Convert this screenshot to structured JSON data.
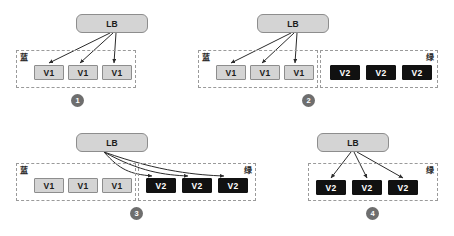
{
  "diagram": {
    "colors": {
      "lb_fill": "#d4d4d4",
      "lb_border": "#8d8d8d",
      "v1_fill": "#d4d4d4",
      "v1_text": "#1b1b1b",
      "v2_fill": "#111111",
      "v2_text": "#ffffff",
      "group_border": "#9a9a9a",
      "badge_fill": "#6e6e6e",
      "arrow": "#2b2b2b",
      "background": "#ffffff"
    },
    "labels": {
      "lb": "LB",
      "v1": "V1",
      "v2": "V2",
      "blue_group": "蓝",
      "green_group": "绿"
    },
    "panels": [
      {
        "id": "panel-1",
        "step": "1",
        "lb": "LB",
        "groups": [
          {
            "name": "blue",
            "label": "蓝",
            "label_side": "left",
            "nodes": [
              "V1",
              "V1",
              "V1"
            ],
            "node_type": "v1",
            "receives_traffic": true
          }
        ]
      },
      {
        "id": "panel-2",
        "step": "2",
        "lb": "LB",
        "groups": [
          {
            "name": "blue",
            "label": "蓝",
            "label_side": "left",
            "nodes": [
              "V1",
              "V1",
              "V1"
            ],
            "node_type": "v1",
            "receives_traffic": true
          },
          {
            "name": "green",
            "label": "绿",
            "label_side": "right",
            "nodes": [
              "V2",
              "V2",
              "V2"
            ],
            "node_type": "v2",
            "receives_traffic": false
          }
        ]
      },
      {
        "id": "panel-3",
        "step": "3",
        "lb": "LB",
        "groups": [
          {
            "name": "blue",
            "label": "蓝",
            "label_side": "left",
            "nodes": [
              "V1",
              "V1",
              "V1"
            ],
            "node_type": "v1",
            "receives_traffic": false
          },
          {
            "name": "green",
            "label": "绿",
            "label_side": "right",
            "nodes": [
              "V2",
              "V2",
              "V2"
            ],
            "node_type": "v2",
            "receives_traffic": true
          }
        ]
      },
      {
        "id": "panel-4",
        "step": "4",
        "lb": "LB",
        "groups": [
          {
            "name": "green",
            "label": "绿",
            "label_side": "right",
            "nodes": [
              "V2",
              "V2",
              "V2"
            ],
            "node_type": "v2",
            "receives_traffic": true
          }
        ]
      }
    ]
  }
}
